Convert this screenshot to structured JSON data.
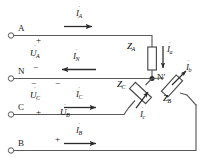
{
  "diagram": {
    "type": "electrical-schematic",
    "background_color": "#ffffff",
    "line_color": "#4a4a4a",
    "text_color": "#1a1a1a"
  },
  "terminals": [
    {
      "name": "terminal-a",
      "label": "A",
      "x": 18,
      "y": 31
    },
    {
      "name": "terminal-n",
      "label": "N",
      "x": 18,
      "y": 74
    },
    {
      "name": "terminal-c",
      "label": "C",
      "x": 18,
      "y": 110
    },
    {
      "name": "terminal-b",
      "label": "B",
      "x": 18,
      "y": 146
    }
  ],
  "node": {
    "label": "N′",
    "name": "node-n-prime"
  },
  "polarity_marks": [
    {
      "name": "plus-a",
      "label": "+",
      "x": 36,
      "y": 39
    },
    {
      "name": "minus-a",
      "label": "−",
      "x": 58,
      "y": 68
    },
    {
      "name": "minus-c-upper",
      "label": "−",
      "x": 31,
      "y": 82
    },
    {
      "name": "minus-c-second",
      "label": "−",
      "x": 55,
      "y": 82
    },
    {
      "name": "plus-c",
      "label": "+",
      "x": 36,
      "y": 113
    },
    {
      "name": "plus-b",
      "label": "+",
      "x": 55,
      "y": 140
    }
  ],
  "voltages": [
    {
      "name": "voltage-ua",
      "symbol": "U",
      "sub": "A",
      "x": 33,
      "y": 53
    },
    {
      "name": "voltage-uc",
      "symbol": "U",
      "sub": "C",
      "x": 33,
      "y": 96
    },
    {
      "name": "voltage-ub",
      "symbol": "U",
      "sub": "B",
      "x": 60,
      "y": 112
    }
  ],
  "currents": [
    {
      "name": "current-ia",
      "symbol": "I",
      "sub": "A",
      "x": 78,
      "y": 12,
      "direction": "right"
    },
    {
      "name": "current-in",
      "symbol": "I",
      "sub": "N",
      "x": 72,
      "y": 55,
      "direction": "left"
    },
    {
      "name": "current-ic",
      "symbol": "I",
      "sub": "C",
      "x": 78,
      "y": 93,
      "direction": "right"
    },
    {
      "name": "current-ib",
      "symbol": "I",
      "sub": "B",
      "x": 76,
      "y": 129,
      "direction": "right"
    },
    {
      "name": "current-ia-load",
      "symbol": "I",
      "sub": "a",
      "x": 168,
      "y": 43,
      "direction": "down"
    },
    {
      "name": "current-ib-load",
      "symbol": "I",
      "sub": "b",
      "x": 184,
      "y": 68,
      "direction": "up-right"
    },
    {
      "name": "current-ic-load",
      "symbol": "I",
      "sub": "c",
      "x": 139,
      "y": 108,
      "direction": "up-right"
    }
  ],
  "impedances": [
    {
      "name": "impedance-za",
      "symbol": "Z",
      "sub": "A",
      "x": 130,
      "y": 45
    },
    {
      "name": "impedance-zb",
      "symbol": "Z",
      "sub": "B",
      "x": 168,
      "y": 93
    },
    {
      "name": "impedance-zc",
      "symbol": "Z",
      "sub": "C",
      "x": 119,
      "y": 82
    }
  ]
}
